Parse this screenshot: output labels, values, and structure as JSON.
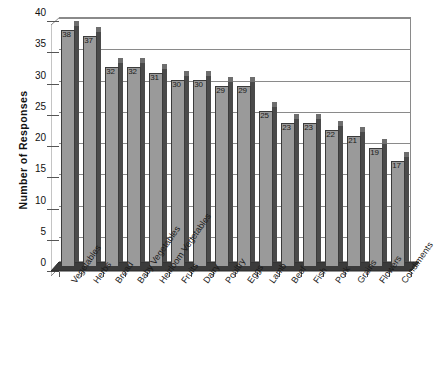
{
  "chart_data": {
    "type": "bar",
    "title": "",
    "xlabel": "",
    "ylabel": "Number of Responses",
    "ylim": [
      0,
      40
    ],
    "ytick_step": 5,
    "yticks": [
      40,
      35,
      30,
      25,
      20,
      15,
      10,
      5,
      0
    ],
    "grid": true,
    "legend": "none",
    "orientation": "vertical",
    "style_3d": true,
    "data_labels_shown": true,
    "xtick_rotation_deg": -55,
    "categories": [
      "Vegetables",
      "Herbs",
      "Bread",
      "Baby Vegetables",
      "Heirloom Vegetables",
      "Fruits",
      "Dairy",
      "Poultry",
      "Eggs",
      "Lamb",
      "Beef",
      "Fish",
      "Pork",
      "Grains",
      "Flowers",
      "Condiments"
    ],
    "values": [
      38,
      37,
      32,
      32,
      31,
      30,
      30,
      29,
      29,
      25,
      23,
      23,
      22,
      21,
      19,
      17
    ],
    "series": [
      {
        "name": "Number of Responses",
        "values": [
          38,
          37,
          32,
          32,
          31,
          30,
          30,
          29,
          29,
          25,
          23,
          23,
          22,
          21,
          19,
          17
        ]
      }
    ],
    "colors": {
      "bar_face": "#9a9a9a",
      "bar_side": "#4a4a4a",
      "bar_top": "#6e6e6e",
      "bar_outline": "#3b3b3b",
      "gridline": "#8a8a8a",
      "plot_background": "#ffffff",
      "floor": "#3b3b3b",
      "text": "#1a1a1a"
    }
  }
}
